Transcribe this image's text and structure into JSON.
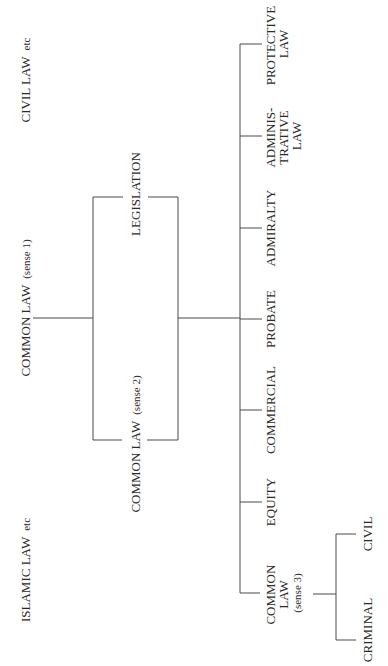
{
  "diagram": {
    "orientation": "rotated-90-ccw",
    "line_color": "#4a4a4a",
    "text_color": "#2a2a2a",
    "top_level": {
      "civil_law": {
        "main": "CIVIL LAW",
        "suffix": "etc"
      },
      "common_law_sense1": {
        "main": "COMMON LAW",
        "suffix": "(sense 1)"
      },
      "islamic_law": {
        "main": "ISLAMIC LAW",
        "suffix": "etc"
      }
    },
    "sources": {
      "legislation": {
        "label": "LEGISLATION"
      },
      "common_law_sense2": {
        "main": "COMMON LAW",
        "suffix": "(sense 2)"
      }
    },
    "branches": [
      {
        "id": "protective",
        "lines": [
          "PROTECTIVE",
          "LAW"
        ]
      },
      {
        "id": "administrative",
        "lines": [
          "ADMINIS-",
          "TRATIVE",
          "LAW"
        ]
      },
      {
        "id": "admiralty",
        "lines": [
          "ADMIRALTY"
        ]
      },
      {
        "id": "probate",
        "lines": [
          "PROBATE"
        ]
      },
      {
        "id": "commercial",
        "lines": [
          "COMMERCIAL"
        ]
      },
      {
        "id": "equity",
        "lines": [
          "EQUITY"
        ]
      },
      {
        "id": "common_law_sense3",
        "lines": [
          "COMMON",
          "LAW",
          "(sense 3)"
        ]
      }
    ],
    "sense3_children": [
      {
        "id": "civil",
        "label": "CIVIL"
      },
      {
        "id": "criminal",
        "label": "CRIMINAL"
      }
    ]
  }
}
